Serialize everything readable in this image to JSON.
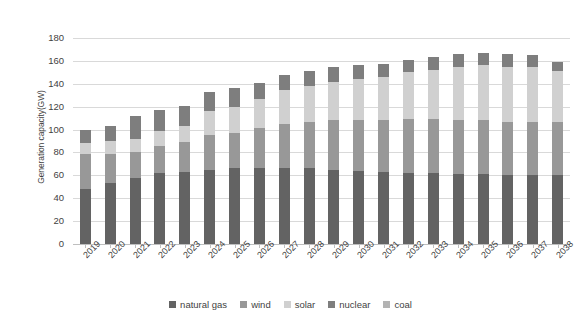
{
  "chart_data": {
    "type": "bar",
    "subtype": "stacked-bar",
    "title": "",
    "xlabel": "",
    "ylabel": "Generation capacity(GW)",
    "ylim": [
      0,
      180
    ],
    "ytick_step": 20,
    "yticks": [
      180,
      160,
      140,
      120,
      100,
      80,
      60,
      40,
      20,
      0
    ],
    "grid": true,
    "legend_position": "bottom",
    "categories": [
      "2019",
      "2020",
      "2021",
      "2022",
      "2023",
      "2024",
      "2025",
      "2026",
      "2027",
      "2038_placeholder_unused",
      "2029",
      "2030",
      "2031",
      "2032",
      "2033",
      "2034",
      "2035",
      "2036",
      "2037",
      "2038"
    ],
    "x": [
      "2019",
      "2020",
      "2021",
      "2022",
      "2023",
      "2024",
      "2025",
      "2026",
      "2027",
      "2028",
      "2029",
      "2030",
      "2031",
      "2032",
      "2033",
      "2034",
      "2035",
      "2036",
      "2037",
      "2038"
    ],
    "series": [
      {
        "name": "natural gas",
        "color": "#636363",
        "values": [
          48,
          53,
          58,
          62,
          63,
          65,
          66,
          66,
          66,
          66,
          65,
          64,
          63,
          62,
          62,
          61,
          61,
          60,
          60,
          60
        ]
      },
      {
        "name": "wind",
        "color": "#989898",
        "values": [
          31,
          26,
          22,
          24,
          26,
          30,
          31,
          35,
          39,
          41,
          43,
          44,
          45,
          47,
          47,
          47,
          47,
          47,
          47,
          47
        ]
      },
      {
        "name": "solar",
        "color": "#d0d0d0",
        "values": [
          9,
          11,
          12,
          13,
          14,
          21,
          23,
          26,
          30,
          31,
          34,
          36,
          38,
          41,
          43,
          47,
          48,
          48,
          48,
          44
        ]
      },
      {
        "name": "nuclear",
        "color": "#7e7e7e",
        "values": [
          12,
          13,
          20,
          18,
          18,
          17,
          16,
          14,
          13,
          13,
          13,
          12,
          11,
          11,
          11,
          11,
          11,
          11,
          10,
          8
        ]
      },
      {
        "name": "coal",
        "color": "#b3b3b3",
        "values": [
          0,
          0,
          0,
          0,
          0,
          0,
          0,
          0,
          0,
          0,
          0,
          0,
          0,
          0,
          0,
          0,
          0,
          0,
          0,
          0
        ]
      }
    ],
    "totals": [
      100,
      103,
      112,
      117,
      121,
      133,
      136,
      141,
      148,
      151,
      155,
      156,
      157,
      161,
      163,
      166,
      167,
      166,
      165,
      159
    ]
  },
  "legend": {
    "items": [
      {
        "label": "natural gas",
        "color": "#636363"
      },
      {
        "label": "wind",
        "color": "#989898"
      },
      {
        "label": "solar",
        "color": "#d0d0d0"
      },
      {
        "label": "nuclear",
        "color": "#7e7e7e"
      },
      {
        "label": "coal",
        "color": "#b3b3b3"
      }
    ]
  },
  "axis": {
    "y_title": "Generation capacity(GW)"
  }
}
